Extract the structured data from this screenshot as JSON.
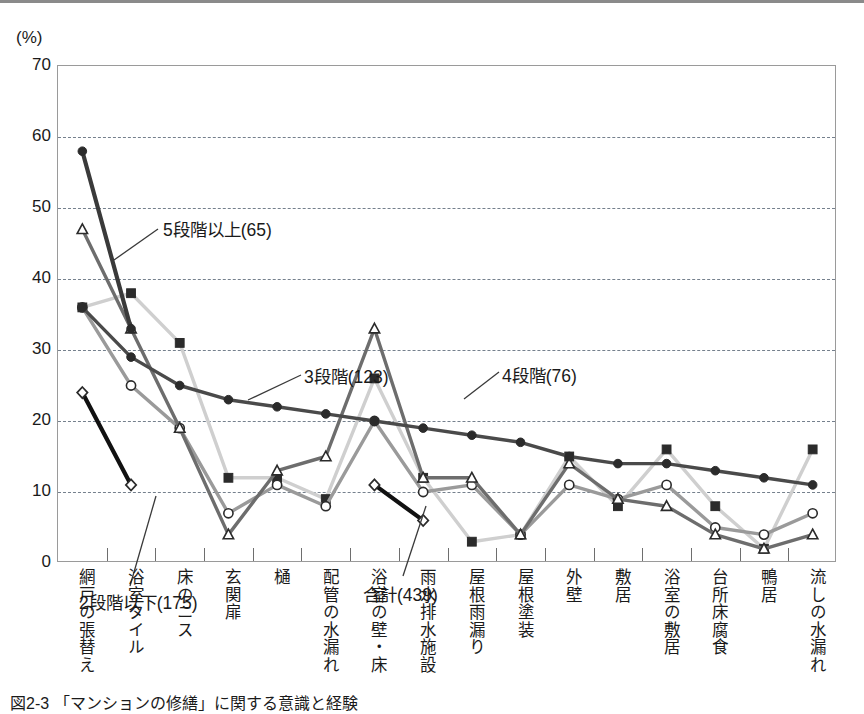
{
  "figure": {
    "y_unit_label": "(%)",
    "caption": "図2-3 「マンションの修繕」に関する意識と経験"
  },
  "chart_data": {
    "type": "line",
    "title": "",
    "xlabel": "",
    "ylabel": "(%)",
    "ylim": [
      0,
      70
    ],
    "ytick_step": 10,
    "yticks": [
      "0",
      "10",
      "20",
      "30",
      "40",
      "50",
      "60",
      "70"
    ],
    "grid": true,
    "legend_position": "inline-annotations",
    "categories": [
      "網戸の張替え",
      "浴室タイル",
      "床のニス",
      "玄関扉",
      "樋",
      "配管の水漏れ",
      "浴室の壁・床",
      "雨水排水施設",
      "屋根雨漏り",
      "屋根塗装",
      "外壁",
      "敷居",
      "浴室の敷居",
      "台所床腐食",
      "鴨居",
      "流しの水漏れ"
    ],
    "series": [
      {
        "name": "合計(439)",
        "label": "合計(439)",
        "marker": "filled-circle",
        "color": "#4a4a4a",
        "values": [
          36,
          29,
          25,
          23,
          22,
          21,
          20,
          19,
          18,
          17,
          15,
          14,
          14,
          13,
          12,
          11
        ]
      },
      {
        "name": "5段階以上(65)",
        "label": "5段階以上(65)",
        "marker": "filled-circle-dark",
        "color": "#3a3a3a",
        "values": [
          58,
          33,
          null,
          null,
          null,
          null,
          null,
          null,
          null,
          null,
          null,
          null,
          null,
          null,
          null,
          null
        ]
      },
      {
        "name": "4段階(76)",
        "label": "4段階(76)",
        "marker": "open-triangle",
        "color": "#6d6d6d",
        "values": [
          47,
          33,
          19,
          4,
          13,
          15,
          33,
          12,
          12,
          4,
          14,
          9,
          8,
          4,
          2,
          4
        ]
      },
      {
        "name": "3段階(123)",
        "label": "3段階(123)",
        "marker": "filled-square",
        "color": "#cfcfcf",
        "values": [
          36,
          38,
          31,
          12,
          12,
          9,
          26,
          12,
          3,
          4,
          15,
          8,
          16,
          8,
          2,
          16
        ]
      },
      {
        "name": "5段階以上(65)-open",
        "label": "5段階以上(65)",
        "marker": "open-circle",
        "color": "#9a9a9a",
        "values": [
          36,
          25,
          19,
          7,
          11,
          8,
          20,
          10,
          11,
          4,
          11,
          9,
          11,
          5,
          4,
          7
        ]
      },
      {
        "name": "2段階以下(175)",
        "label": "2段階以下(175)",
        "marker": "open-diamond",
        "color": "#111111",
        "values": [
          24,
          11,
          null,
          null,
          null,
          null,
          11,
          6,
          null,
          null,
          null,
          null,
          null,
          null,
          null,
          null
        ]
      }
    ],
    "annotations": [
      {
        "text": "5段階以上(65)",
        "x_px": 105,
        "y_px": 150
      },
      {
        "text": "3段階(123)",
        "x_px": 246,
        "y_px": 297
      },
      {
        "text": "4段階(76)",
        "x_px": 444,
        "y_px": 296
      },
      {
        "text": "2段階以下(175)",
        "x_px": 21,
        "y_px": 523
      },
      {
        "text": "合計(439)",
        "x_px": 305,
        "y_px": 515
      }
    ]
  }
}
